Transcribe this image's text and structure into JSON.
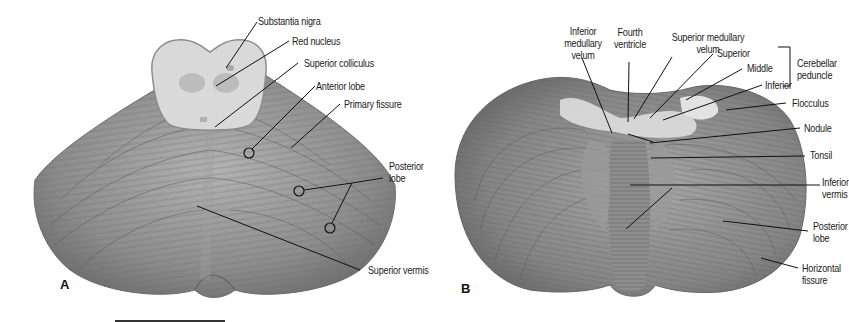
{
  "figure": {
    "panels": [
      {
        "id": "A",
        "letter": "A",
        "view": "superior view of cerebellum with midbrain section",
        "labels": {
          "substantia_nigra": "Substantia nigra",
          "red_nucleus": "Red nucleus",
          "superior_colliculus": "Superior colliculus",
          "anterior_lobe": "Anterior lobe",
          "primary_fissure": "Primary fissure",
          "posterior_lobe_1": "Posterior",
          "posterior_lobe_2": "lobe",
          "superior_vermis": "Superior vermis"
        }
      },
      {
        "id": "B",
        "letter": "B",
        "view": "inferior view of cerebellum",
        "labels": {
          "inferior_medullary_velum_1": "Inferior",
          "inferior_medullary_velum_2": "medullary",
          "inferior_medullary_velum_3": "velum",
          "fourth_ventricle_1": "Fourth",
          "fourth_ventricle_2": "ventricle",
          "superior_medullary_velum_1": "Superior medullary",
          "superior_medullary_velum_2": "velum",
          "peduncle_superior": "Superior",
          "peduncle_middle": "Middle",
          "peduncle_inferior": "Inferior",
          "cerebellar_peduncle_1": "Cerebellar",
          "cerebellar_peduncle_2": "peduncle",
          "flocculus": "Flocculus",
          "nodule": "Nodule",
          "tonsil": "Tonsil",
          "inferior_vermis_1": "Inferior",
          "inferior_vermis_2": "vermis",
          "posterior_lobe_1": "Posterior",
          "posterior_lobe_2": "lobe",
          "horizontal_fissure_1": "Horizontal",
          "horizontal_fissure_2": "fissure"
        }
      }
    ],
    "colors": {
      "tissue": "#8a8a8a",
      "tissue_dark": "#6e6e6e",
      "tissue_light": "#b9b9b9",
      "midbrain": "#d6d6d6",
      "leader": "#111111"
    }
  }
}
